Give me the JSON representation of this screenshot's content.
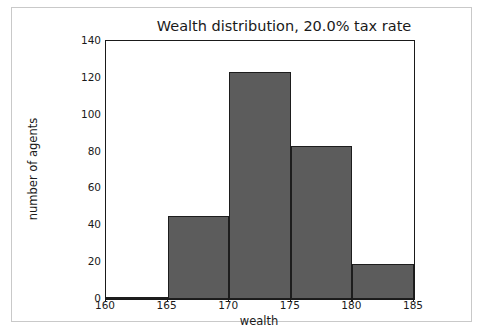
{
  "chart_data": {
    "type": "bar",
    "title": "Wealth distribution, 20.0% tax rate",
    "xlabel": "wealth",
    "ylabel": "number of agents",
    "xlim": [
      160,
      185
    ],
    "ylim": [
      0,
      140
    ],
    "xticks": [
      160,
      165,
      170,
      175,
      180,
      185
    ],
    "yticks": [
      0,
      20,
      40,
      60,
      80,
      100,
      120,
      140
    ],
    "grid": false,
    "legend": null,
    "bin_edges": [
      160,
      165,
      170,
      175,
      180,
      185
    ],
    "categories": [
      "160-165",
      "165-170",
      "170-175",
      "175-180",
      "180-185"
    ],
    "values": [
      1,
      45,
      123,
      83,
      19
    ],
    "bar_fill_color": "#5c5c5c",
    "bar_edge_color": "#1d1d1d"
  },
  "figure": {
    "background_color": "#ffffff",
    "frame_color": "#c9c9c9"
  }
}
